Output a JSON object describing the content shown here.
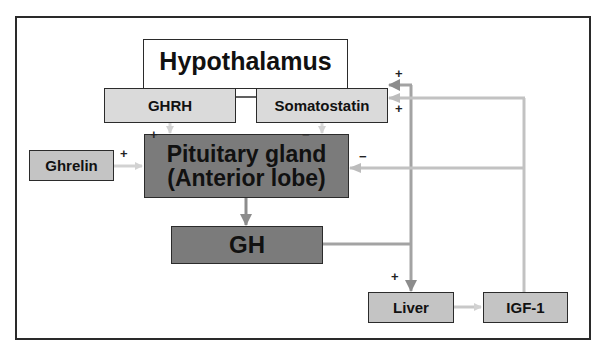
{
  "diagram": {
    "nodes": {
      "hypothalamus": "Hypothalamus",
      "ghrh": "GHRH",
      "somatostatin": "Somatostatin",
      "ghrelin": "Ghrelin",
      "pituitary_line1": "Pituitary gland",
      "pituitary_line2": "(Anterior lobe)",
      "gh": "GH",
      "liver": "Liver",
      "igf1": "IGF-1"
    },
    "signs": {
      "ghrh_to_pituitary": "+",
      "somatostatin_to_pituitary": "−",
      "ghrelin_to_pituitary": "+",
      "igf1_to_pituitary": "−",
      "gh_to_somatostatin": "+",
      "igf1_to_somatostatin": "+",
      "gh_to_liver": "+"
    },
    "edges": [
      {
        "from": "GHRH",
        "to": "Pituitary gland",
        "sign": "+"
      },
      {
        "from": "Somatostatin",
        "to": "Pituitary gland",
        "sign": "−"
      },
      {
        "from": "Ghrelin",
        "to": "Pituitary gland",
        "sign": "+"
      },
      {
        "from": "Pituitary gland",
        "to": "GH",
        "sign": ""
      },
      {
        "from": "GH",
        "to": "Liver",
        "sign": "+"
      },
      {
        "from": "GH",
        "to": "Somatostatin",
        "sign": "+"
      },
      {
        "from": "Liver",
        "to": "IGF-1",
        "sign": ""
      },
      {
        "from": "IGF-1",
        "to": "Somatostatin",
        "sign": "+"
      },
      {
        "from": "IGF-1",
        "to": "Pituitary gland",
        "sign": "−"
      }
    ],
    "colors": {
      "light_box": "#dadada",
      "dark_box": "#7b7b7b",
      "mid_box": "#c4c4c4",
      "gh_line": "#9e9e9e",
      "igf_line": "#c2c2c2",
      "border": "#2b2b2b"
    }
  }
}
